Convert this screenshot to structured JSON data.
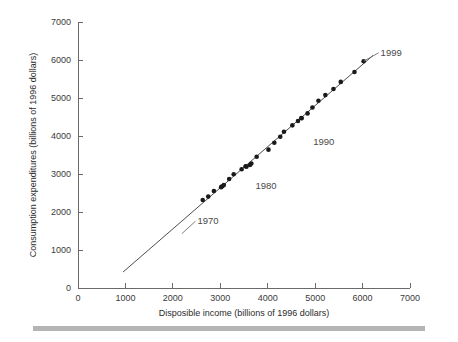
{
  "figure": {
    "name": "consumption-vs-disposable-income-scatter"
  },
  "axes": {
    "x_title": "Disposible income (billions of 1996 dollars)",
    "y_title": "Consumption expenditures (billions of 1996 dollars)",
    "x_ticks": [
      "0",
      "1000",
      "2000",
      "3000",
      "4000",
      "5000",
      "6000",
      "7000"
    ],
    "y_ticks": [
      "0",
      "1000",
      "2000",
      "3000",
      "4000",
      "5000",
      "6000",
      "7000"
    ]
  },
  "annotations": [
    {
      "label": "1970"
    },
    {
      "label": "1980"
    },
    {
      "label": "1990"
    },
    {
      "label": "1999"
    }
  ],
  "colors": {
    "point": "#1a1a1a",
    "line": "#4d4d4d",
    "axis": "#6a6a6a",
    "text": "#2b2b2b",
    "footer_bar": "#b4b4b4"
  },
  "chart_data": {
    "type": "scatter",
    "title": "",
    "xlabel": "Disposible income (billions of 1996 dollars)",
    "ylabel": "Consumption expenditures (billions of 1996 dollars)",
    "xlim": [
      0,
      7000
    ],
    "ylim": [
      0,
      7000
    ],
    "xticks": [
      0,
      1000,
      2000,
      3000,
      4000,
      5000,
      6000,
      7000
    ],
    "yticks": [
      0,
      1000,
      2000,
      3000,
      4000,
      5000,
      6000,
      7000
    ],
    "grid": false,
    "legend": null,
    "series": [
      {
        "name": "Annual observations 1970-1999",
        "marker": "filled-circle",
        "points": [
          {
            "year": 1970,
            "x": 2630,
            "y": 2317
          },
          {
            "year": 1971,
            "x": 2746,
            "y": 2405
          },
          {
            "year": 1972,
            "x": 2865,
            "y": 2551
          },
          {
            "year": 1973,
            "x": 3044,
            "y": 2676
          },
          {
            "year": 1974,
            "x": 3017,
            "y": 2654
          },
          {
            "year": 1975,
            "x": 3075,
            "y": 2710
          },
          {
            "year": 1976,
            "x": 3187,
            "y": 2868
          },
          {
            "year": 1977,
            "x": 3283,
            "y": 2992
          },
          {
            "year": 1978,
            "x": 3450,
            "y": 3125
          },
          {
            "year": 1979,
            "x": 3533,
            "y": 3204
          },
          {
            "year": 1980,
            "x": 3552,
            "y": 3193
          },
          {
            "year": 1981,
            "x": 3626,
            "y": 3236
          },
          {
            "year": 1982,
            "x": 3655,
            "y": 3276
          },
          {
            "year": 1983,
            "x": 3767,
            "y": 3454
          },
          {
            "year": 1984,
            "x": 4016,
            "y": 3641
          },
          {
            "year": 1985,
            "x": 4139,
            "y": 3821
          },
          {
            "year": 1986,
            "x": 4264,
            "y": 3981
          },
          {
            "year": 1987,
            "x": 4343,
            "y": 4113
          },
          {
            "year": 1988,
            "x": 4520,
            "y": 4280
          },
          {
            "year": 1989,
            "x": 4638,
            "y": 4394
          },
          {
            "year": 1990,
            "x": 4709,
            "y": 4475
          },
          {
            "year": 1991,
            "x": 4715,
            "y": 4467
          },
          {
            "year": 1992,
            "x": 4840,
            "y": 4595
          },
          {
            "year": 1993,
            "x": 4943,
            "y": 4749
          },
          {
            "year": 1994,
            "x": 5069,
            "y": 4929
          },
          {
            "year": 1995,
            "x": 5215,
            "y": 5076
          },
          {
            "year": 1996,
            "x": 5386,
            "y": 5238
          },
          {
            "year": 1997,
            "x": 5540,
            "y": 5424
          },
          {
            "year": 1998,
            "x": 5829,
            "y": 5684
          },
          {
            "year": 1999,
            "x": 6022,
            "y": 5969
          }
        ]
      }
    ],
    "fit_line": {
      "name": "regression-line",
      "x_start": 950,
      "y_start": 420,
      "x_end": 6220,
      "y_end": 6120
    },
    "annotations": [
      {
        "label": "1970",
        "x": 2520,
        "y": 1680,
        "points_to_x": 2190,
        "points_to_y": 1430
      },
      {
        "label": "1980",
        "x": 3740,
        "y": 2610,
        "points_to_x": 3740,
        "points_to_y": 2610
      },
      {
        "label": "1990",
        "x": 4960,
        "y": 3770,
        "points_to_x": 4960,
        "points_to_y": 3770
      },
      {
        "label": "1999",
        "x": 6380,
        "y": 6110,
        "points_to_x": 6022,
        "points_to_y": 5969
      }
    ]
  }
}
